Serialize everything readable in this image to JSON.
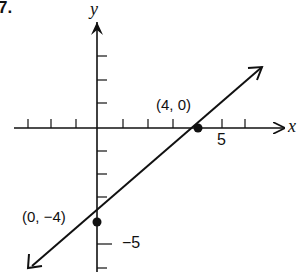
{
  "problem_number": "7.",
  "axes": {
    "x_label": "x",
    "y_label": "y",
    "x_tick_label": "5",
    "y_tick_label": "−5"
  },
  "points": [
    {
      "label": "(4, 0)",
      "x": 4,
      "y": 0
    },
    {
      "label": "(0, −4)",
      "x": 0,
      "y": -4
    }
  ],
  "line": {
    "equation": "y = x - 4",
    "slope": 1,
    "intercept": -4,
    "color": "#111111"
  }
}
